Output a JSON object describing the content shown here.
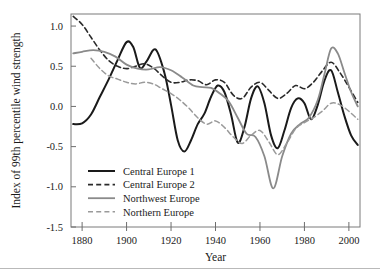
{
  "chart_data": {
    "type": "line",
    "title": "",
    "xlabel": "Year",
    "ylabel": "Index of 99th percentile wind strength",
    "xlim": [
      1875,
      2005
    ],
    "ylim": [
      -1.5,
      1.15
    ],
    "grid": false,
    "legend_position": "bottom-left-inside",
    "xticks": [
      1880,
      1900,
      1920,
      1940,
      1960,
      1980,
      2000
    ],
    "xtick_labels": [
      "1880",
      "1900",
      "1920",
      "1940",
      "1960",
      "1980",
      "2000"
    ],
    "yticks": [
      1.0,
      0.5,
      0.0,
      -0.5,
      -1.0,
      -1.5
    ],
    "ytick_labels": [
      "1.0",
      "0.5",
      "0.0",
      "-0.5",
      "-1.0",
      "-1.5"
    ],
    "series": [
      {
        "name": "Central Europe 1",
        "color": "#1a1a1a",
        "style": "solid",
        "width": 2.0,
        "x": [
          1876,
          1880,
          1884,
          1888,
          1892,
          1896,
          1900,
          1903,
          1906,
          1909,
          1913,
          1917,
          1920,
          1923,
          1926,
          1929,
          1932,
          1935,
          1938,
          1941,
          1944,
          1947,
          1950,
          1953,
          1956,
          1959,
          1962,
          1965,
          1968,
          1971,
          1974,
          1977,
          1980,
          1983,
          1986,
          1989,
          1992,
          1995,
          1998,
          2001,
          2004
        ],
        "y": [
          -0.22,
          -0.21,
          -0.1,
          0.12,
          0.34,
          0.58,
          0.8,
          0.74,
          0.48,
          0.56,
          0.71,
          0.42,
          0.02,
          -0.42,
          -0.56,
          -0.42,
          -0.22,
          -0.09,
          0.12,
          0.26,
          0.18,
          -0.1,
          -0.45,
          -0.26,
          0.1,
          0.25,
          0.04,
          -0.36,
          -0.52,
          -0.3,
          -0.02,
          0.1,
          0.04,
          -0.16,
          0.02,
          0.32,
          0.45,
          0.18,
          -0.12,
          -0.36,
          -0.48
        ]
      },
      {
        "name": "Central Europe 2",
        "color": "#2a2a2a",
        "style": "dashed",
        "width": 1.6,
        "x": [
          1876,
          1880,
          1884,
          1888,
          1892,
          1896,
          1900,
          1904,
          1908,
          1912,
          1916,
          1920,
          1924,
          1928,
          1932,
          1936,
          1940,
          1944,
          1948,
          1952,
          1956,
          1960,
          1964,
          1968,
          1972,
          1976,
          1980,
          1984,
          1988,
          1992,
          1996,
          2000,
          2004
        ],
        "y": [
          1.12,
          1.02,
          0.86,
          0.7,
          0.57,
          0.5,
          0.47,
          0.5,
          0.53,
          0.48,
          0.38,
          0.3,
          0.3,
          0.33,
          0.32,
          0.27,
          0.33,
          0.3,
          0.14,
          0.1,
          0.24,
          0.3,
          0.2,
          0.1,
          0.16,
          0.26,
          0.22,
          0.3,
          0.44,
          0.55,
          0.42,
          0.24,
          0.05
        ]
      },
      {
        "name": "Northwest Europe",
        "color": "#8a8a8a",
        "style": "solid",
        "width": 1.8,
        "x": [
          1876,
          1880,
          1885,
          1890,
          1895,
          1900,
          1905,
          1910,
          1915,
          1920,
          1925,
          1930,
          1934,
          1938,
          1942,
          1946,
          1950,
          1954,
          1958,
          1962,
          1966,
          1970,
          1974,
          1978,
          1982,
          1986,
          1989,
          1992,
          1995,
          1998,
          2001,
          2004
        ],
        "y": [
          0.66,
          0.68,
          0.7,
          0.68,
          0.62,
          0.52,
          0.47,
          0.46,
          0.49,
          0.45,
          0.36,
          0.26,
          0.24,
          0.23,
          0.16,
          0.06,
          -0.14,
          -0.34,
          -0.38,
          -0.62,
          -1.02,
          -0.62,
          -0.34,
          -0.22,
          -0.14,
          0.08,
          0.4,
          0.72,
          0.66,
          0.42,
          0.18,
          0.0
        ]
      },
      {
        "name": "Northern Europe",
        "color": "#9a9a9a",
        "style": "dashed",
        "width": 1.5,
        "x": [
          1884,
          1888,
          1892,
          1896,
          1900,
          1904,
          1908,
          1912,
          1916,
          1920,
          1924,
          1928,
          1932,
          1936,
          1940,
          1944,
          1948,
          1952,
          1956,
          1960,
          1964,
          1968,
          1972,
          1976,
          1980,
          1984,
          1988,
          1992,
          1996,
          2000,
          2004
        ],
        "y": [
          0.6,
          0.47,
          0.38,
          0.34,
          0.3,
          0.28,
          0.3,
          0.28,
          0.22,
          0.16,
          0.08,
          -0.02,
          -0.14,
          -0.22,
          -0.18,
          -0.26,
          -0.38,
          -0.46,
          -0.36,
          -0.3,
          -0.44,
          -0.6,
          -0.46,
          -0.28,
          -0.2,
          -0.14,
          -0.06,
          0.04,
          0.02,
          -0.06,
          -0.16
        ]
      }
    ]
  },
  "legend": {
    "items": [
      {
        "label": "Central Europe 1"
      },
      {
        "label": "Central Europe 2"
      },
      {
        "label": "Northwest Europe"
      },
      {
        "label": "Northern Europe"
      }
    ]
  }
}
